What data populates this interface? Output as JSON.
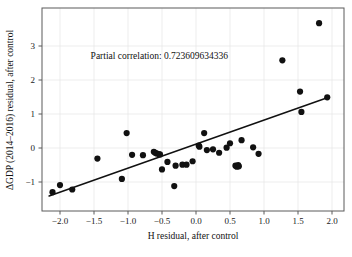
{
  "chart_data": {
    "type": "scatter",
    "title": "",
    "xlabel": "H residual, after control",
    "ylabel": "ΔGDP (2014–2016) residual, after control",
    "xlim": [
      -2.22,
      2.22
    ],
    "ylim": [
      -1.62,
      3.97
    ],
    "grid": true,
    "legend": null,
    "annotations": [
      {
        "name": "partial-correlation",
        "text": "Partial correlation: 0.723609634336",
        "x": -1.55,
        "y": 2.62
      }
    ],
    "xticks": [
      -2.0,
      -1.5,
      -1.0,
      -0.5,
      0.0,
      0.5,
      1.0,
      1.5,
      2.0
    ],
    "xtick_labels": [
      "−2.0",
      "−1.5",
      "−1.0",
      "−0.5",
      "0.0",
      "0.5",
      "1.0",
      "1.5",
      "2.0"
    ],
    "yticks": [
      -1,
      0,
      1,
      2,
      3
    ],
    "ytick_labels": [
      "−1",
      "0",
      "1",
      "2",
      "3"
    ],
    "marker": {
      "shape": "circle",
      "color": "#111111",
      "size_px": 3.1
    },
    "series": [
      {
        "name": "observations",
        "points": [
          [
            -2.11,
            -1.3
          ],
          [
            -2.0,
            -1.09
          ],
          [
            -1.82,
            -1.22
          ],
          [
            -1.45,
            -0.31
          ],
          [
            -1.09,
            -0.91
          ],
          [
            -1.02,
            0.44
          ],
          [
            -0.94,
            -0.2
          ],
          [
            -0.78,
            -0.21
          ],
          [
            -0.62,
            -0.11
          ],
          [
            -0.6,
            -0.14
          ],
          [
            -0.58,
            -0.16
          ],
          [
            -0.55,
            -0.18
          ],
          [
            -0.53,
            -0.19
          ],
          [
            -0.5,
            -0.63
          ],
          [
            -0.42,
            -0.41
          ],
          [
            -0.32,
            -1.12
          ],
          [
            -0.3,
            -0.52
          ],
          [
            -0.2,
            -0.49
          ],
          [
            -0.14,
            -0.49
          ],
          [
            -0.05,
            -0.39
          ],
          [
            0.04,
            0.07
          ],
          [
            0.05,
            0.04
          ],
          [
            0.12,
            0.44
          ],
          [
            0.16,
            -0.06
          ],
          [
            0.25,
            -0.04
          ],
          [
            0.34,
            -0.14
          ],
          [
            0.45,
            0.01
          ],
          [
            0.5,
            0.14
          ],
          [
            0.58,
            -0.52
          ],
          [
            0.6,
            -0.55
          ],
          [
            0.62,
            -0.5
          ],
          [
            0.63,
            -0.54
          ],
          [
            0.67,
            0.23
          ],
          [
            0.84,
            0.02
          ],
          [
            0.92,
            -0.17
          ],
          [
            1.27,
            2.58
          ],
          [
            1.53,
            1.66
          ],
          [
            1.55,
            1.06
          ],
          [
            1.81,
            3.67
          ],
          [
            1.93,
            1.49
          ]
        ]
      }
    ],
    "fit_line": {
      "name": "regression-line",
      "x_start": -2.16,
      "y_start": -1.41,
      "x_end": 1.93,
      "y_end": 1.48,
      "color": "#111111",
      "width_px": 1.5
    },
    "style": {
      "grid_color": "#e8e8e8",
      "axis_color": "#5a5a5a",
      "background": "#ffffff"
    }
  }
}
